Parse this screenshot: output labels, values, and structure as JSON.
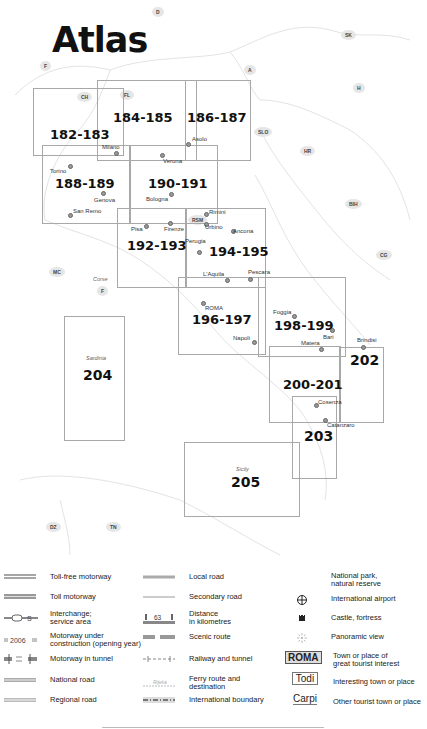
{
  "title": "Atlas",
  "countries": [
    {
      "code": "D",
      "x": 152,
      "y": 7
    },
    {
      "code": "F",
      "x": 40,
      "y": 61
    },
    {
      "code": "A",
      "x": 244,
      "y": 65
    },
    {
      "code": "SK",
      "x": 341,
      "y": 30
    },
    {
      "code": "H",
      "x": 353,
      "y": 83
    },
    {
      "code": "CH",
      "x": 77,
      "y": 92
    },
    {
      "code": "FL",
      "x": 120,
      "y": 90
    },
    {
      "code": "SLO",
      "x": 254,
      "y": 127
    },
    {
      "code": "HR",
      "x": 300,
      "y": 146
    },
    {
      "code": "BIH",
      "x": 345,
      "y": 199
    },
    {
      "code": "CG",
      "x": 376,
      "y": 250
    },
    {
      "code": "MC",
      "x": 49,
      "y": 267
    },
    {
      "code": "RSM",
      "x": 188,
      "y": 215
    },
    {
      "code": "F",
      "x": 97,
      "y": 286
    },
    {
      "code": "DZ",
      "x": 46,
      "y": 522
    },
    {
      "code": "TN",
      "x": 106,
      "y": 522
    }
  ],
  "frames": [
    {
      "page": "182-183",
      "x": 33,
      "y": 88,
      "w": 91,
      "h": 68,
      "lx": 50,
      "ly": 127
    },
    {
      "page": "184-185",
      "x": 97,
      "y": 80,
      "w": 100,
      "h": 81,
      "lx": 113,
      "ly": 110
    },
    {
      "page": "186-187",
      "x": 185,
      "y": 80,
      "w": 66,
      "h": 81,
      "lx": 187,
      "ly": 110
    },
    {
      "page": "188-189",
      "x": 42,
      "y": 145,
      "w": 88,
      "h": 79,
      "lx": 55,
      "ly": 176
    },
    {
      "page": "190-191",
      "x": 130,
      "y": 145,
      "w": 88,
      "h": 79,
      "lx": 148,
      "ly": 176
    },
    {
      "page": "192-193",
      "x": 117,
      "y": 208,
      "w": 69,
      "h": 80,
      "lx": 127,
      "ly": 238
    },
    {
      "page": "194-195",
      "x": 186,
      "y": 208,
      "w": 80,
      "h": 80,
      "lx": 209,
      "ly": 244
    },
    {
      "page": "196-197",
      "x": 178,
      "y": 277,
      "w": 88,
      "h": 78,
      "lx": 192,
      "ly": 312
    },
    {
      "page": "198-199",
      "x": 258,
      "y": 277,
      "w": 88,
      "h": 80,
      "lx": 274,
      "ly": 318
    },
    {
      "page": "202",
      "x": 339,
      "y": 347,
      "w": 45,
      "h": 76,
      "lx": 350,
      "ly": 352
    },
    {
      "page": "200-201",
      "x": 269,
      "y": 346,
      "w": 72,
      "h": 77,
      "lx": 283,
      "ly": 377
    },
    {
      "page": "203",
      "x": 292,
      "y": 396,
      "w": 45,
      "h": 83,
      "lx": 304,
      "ly": 428
    },
    {
      "page": "204",
      "x": 64,
      "y": 316,
      "w": 61,
      "h": 125,
      "lx": 83,
      "ly": 367
    },
    {
      "page": "205",
      "x": 184,
      "y": 442,
      "w": 116,
      "h": 75,
      "lx": 231,
      "ly": 474
    }
  ],
  "cities": [
    {
      "name": "Milano",
      "x": 102,
      "y": 144,
      "dx": 114,
      "dy": 151
    },
    {
      "name": "Asolo",
      "x": 192,
      "y": 136,
      "dx": 186,
      "dy": 142
    },
    {
      "name": "Torino",
      "x": 50,
      "y": 168,
      "dx": 68,
      "dy": 164
    },
    {
      "name": "Verona",
      "x": 163,
      "y": 158,
      "dx": 160,
      "dy": 153
    },
    {
      "name": "Genova",
      "x": 94,
      "y": 197,
      "dx": 101,
      "dy": 191
    },
    {
      "name": "Bologna",
      "x": 146,
      "y": 196,
      "dx": 169,
      "dy": 192
    },
    {
      "name": "San Remo",
      "x": 73,
      "y": 208,
      "dx": 68,
      "dy": 213
    },
    {
      "name": "Rimini",
      "x": 209,
      "y": 209,
      "dx": 204,
      "dy": 212
    },
    {
      "name": "Pisa",
      "x": 131,
      "y": 226,
      "dx": 144,
      "dy": 224
    },
    {
      "name": "Firenze",
      "x": 164,
      "y": 226,
      "dx": 168,
      "dy": 221
    },
    {
      "name": "Urbino",
      "x": 205,
      "y": 224,
      "dx": 204,
      "dy": 222
    },
    {
      "name": "Perugia",
      "x": 185,
      "y": 238,
      "dx": 197,
      "dy": 250
    },
    {
      "name": "Ancona",
      "x": 233,
      "y": 228,
      "dx": 231,
      "dy": 229
    },
    {
      "name": "L'Aquila",
      "x": 203,
      "y": 271,
      "dx": 225,
      "dy": 278
    },
    {
      "name": "Pescara",
      "x": 248,
      "y": 269,
      "dx": 248,
      "dy": 277
    },
    {
      "name": "ROMA",
      "x": 205,
      "y": 305,
      "dx": 201,
      "dy": 301
    },
    {
      "name": "Napoli",
      "x": 233,
      "y": 335,
      "dx": 252,
      "dy": 340
    },
    {
      "name": "Foggia",
      "x": 273,
      "y": 309,
      "dx": 292,
      "dy": 314
    },
    {
      "name": "Bari",
      "x": 323,
      "y": 334,
      "dx": 330,
      "dy": 328
    },
    {
      "name": "Matera",
      "x": 301,
      "y": 340,
      "dx": 319,
      "dy": 347
    },
    {
      "name": "Brindisi",
      "x": 357,
      "y": 337,
      "dx": 361,
      "dy": 345
    },
    {
      "name": "Cosenza",
      "x": 318,
      "y": 399,
      "dx": 314,
      "dy": 403
    },
    {
      "name": "Catanzaro",
      "x": 327,
      "y": 422,
      "dx": 323,
      "dy": 418
    }
  ],
  "regions": [
    {
      "name": "Corse",
      "x": 93,
      "y": 276
    },
    {
      "name": "Sardinia",
      "x": 86,
      "y": 355
    },
    {
      "name": "Sicily",
      "x": 236,
      "y": 466
    }
  ],
  "legend": {
    "col1": [
      {
        "symbol": "toll-free-motorway",
        "label": "Toll-free motorway"
      },
      {
        "symbol": "toll-motorway",
        "label": "Toll motorway"
      },
      {
        "symbol": "interchange",
        "label": "Interchange;\nservice area"
      },
      {
        "symbol": "under-construction",
        "label": "Motorway under\nconstruction (opening year)",
        "year": "2006"
      },
      {
        "symbol": "motorway-tunnel",
        "label": "Motorway in tunnel"
      },
      {
        "symbol": "national-road",
        "label": "National road"
      },
      {
        "symbol": "regional-road",
        "label": "Regional road"
      }
    ],
    "col2": [
      {
        "symbol": "local-road",
        "label": "Local road"
      },
      {
        "symbol": "secondary-road",
        "label": "Secondary road"
      },
      {
        "symbol": "distance",
        "label": "Distance\nin kilometres",
        "value": "63"
      },
      {
        "symbol": "scenic-route",
        "label": "Scenic route"
      },
      {
        "symbol": "railway-tunnel",
        "label": "Railway and tunnel"
      },
      {
        "symbol": "ferry-route",
        "label": "Ferry route and\ndestination",
        "sample": "Rijeka"
      },
      {
        "symbol": "international-boundary",
        "label": "International boundary"
      }
    ],
    "col3": [
      {
        "symbol": "national-park",
        "label": "National park,\nnatural reserve"
      },
      {
        "symbol": "airport",
        "label": "International airport"
      },
      {
        "symbol": "castle",
        "label": "Castle, fortress"
      },
      {
        "symbol": "panoramic-view",
        "label": "Panoramic view"
      },
      {
        "symbol": "great-town",
        "label": "Town or place of\ngreat tourist interest",
        "sample": "ROMA"
      },
      {
        "symbol": "interesting-town",
        "label": "Interesting town or place",
        "sample": "Todi"
      },
      {
        "symbol": "other-town",
        "label": "Other tourist town or place",
        "sample": "Carpi"
      }
    ]
  }
}
